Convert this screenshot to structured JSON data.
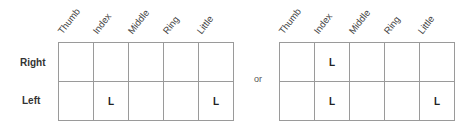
{
  "columns": [
    "Thumb",
    "Index",
    "Middle",
    "Ring",
    "Little"
  ],
  "rows": [
    "Right",
    "Left"
  ],
  "separator": "or",
  "tables": [
    {
      "cells": [
        [
          "",
          "",
          "",
          "",
          ""
        ],
        [
          "",
          "L",
          "",
          "",
          "L"
        ]
      ]
    },
    {
      "cells": [
        [
          "",
          "L",
          "",
          "",
          ""
        ],
        [
          "",
          "L",
          "",
          "",
          "L"
        ]
      ]
    }
  ]
}
